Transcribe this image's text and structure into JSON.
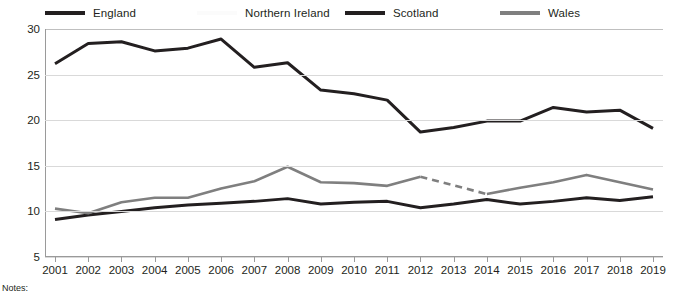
{
  "chart_data": {
    "type": "line",
    "title": "",
    "subtitle": "",
    "xlabel": "",
    "ylabel": "",
    "categories": [
      "2001",
      "2002",
      "2003",
      "2004",
      "2005",
      "2006",
      "2007",
      "2008",
      "2009",
      "2010",
      "2011",
      "2012",
      "2013",
      "2014",
      "2015",
      "2016",
      "2017",
      "2018",
      "2019"
    ],
    "xlim": [
      2001,
      2019
    ],
    "ylim": [
      5,
      30
    ],
    "yticks": [
      5,
      10,
      15,
      20,
      25,
      30
    ],
    "grid": "horizontal",
    "legend_position": "top",
    "series": [
      {
        "name": "England",
        "color": "#231f20",
        "values": [
          9.1,
          9.6,
          10.0,
          10.4,
          10.7,
          10.9,
          11.1,
          11.4,
          10.8,
          11.0,
          11.1,
          10.4,
          10.8,
          11.3,
          10.8,
          11.1,
          11.5,
          11.2,
          11.6
        ]
      },
      {
        "name": "Northern Ireland",
        "color": "#fafafa",
        "values": [
          null,
          null,
          null,
          null,
          null,
          null,
          null,
          null,
          null,
          null,
          null,
          null,
          null,
          null,
          null,
          null,
          null,
          null,
          null
        ]
      },
      {
        "name": "Scotland",
        "color": "#231f20",
        "values": [
          26.2,
          28.4,
          28.6,
          27.6,
          27.9,
          28.9,
          25.8,
          26.3,
          23.3,
          22.9,
          22.2,
          18.7,
          19.2,
          19.9,
          19.9,
          21.4,
          20.9,
          21.1,
          19.1
        ]
      },
      {
        "name": "Wales",
        "color": "#7f7f7f",
        "values": [
          10.3,
          9.8,
          11.0,
          11.5,
          11.5,
          12.5,
          13.3,
          14.9,
          13.2,
          13.1,
          12.8,
          13.8,
          null,
          11.9,
          12.6,
          13.2,
          14.0,
          13.2,
          12.4
        ],
        "break_note": "gap between 2012 and 2014 drawn as dashed segment"
      }
    ],
    "ytick_labels": [
      "30",
      "25",
      "20",
      "15",
      "10",
      "5"
    ],
    "xtick_labels": [
      "2001",
      "2002",
      "2003",
      "2004",
      "2005",
      "2006",
      "2007",
      "2008",
      "2009",
      "2010",
      "2011",
      "2012",
      "2013",
      "2014",
      "2015",
      "2016",
      "2017",
      "2018",
      "2019"
    ]
  },
  "legend": {
    "items": [
      {
        "label": "England",
        "color": "#231f20",
        "left": 45
      },
      {
        "label": "Northern Ireland",
        "color": "#fbfbfb",
        "left": 197
      },
      {
        "label": "Scotland",
        "color": "#231f20",
        "left": 345
      },
      {
        "label": "Wales",
        "color": "#7f7f7f",
        "left": 500
      }
    ]
  },
  "footer": {
    "notes_label": "Notes:"
  }
}
